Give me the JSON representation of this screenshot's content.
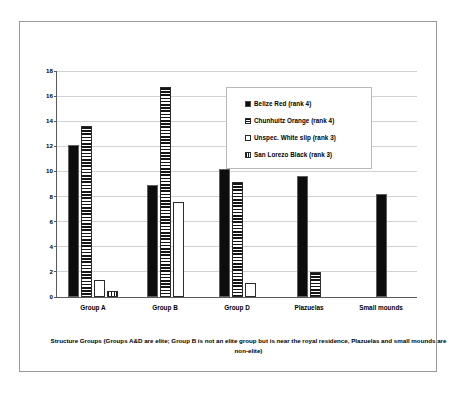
{
  "chart_data": {
    "type": "bar",
    "title": "",
    "xlabel": "Structure Groups (Groups A&D are elite; Group B is not an elite group but is near the royal residence, Plazuelas and small mounds are non-elite)",
    "ylabel": "",
    "ylim": [
      0,
      18
    ],
    "ytick_step": 2,
    "yticks": [
      0,
      2,
      4,
      6,
      8,
      10,
      12,
      14,
      16,
      18
    ],
    "grid": true,
    "grid_axis": "y",
    "legend_position": "upper-right-inside",
    "categories": [
      "Group A",
      "Group B",
      "Group D",
      "Plazuelas",
      "Small mounds"
    ],
    "series": [
      {
        "name": "Belize Red (rank 4)",
        "fill": "solid-black",
        "values": [
          12.1,
          8.9,
          10.2,
          9.6,
          8.2
        ]
      },
      {
        "name": "Chunhuitz Orange (rank 4)",
        "fill": "horizontal-hatch",
        "values": [
          13.6,
          16.7,
          9.2,
          2.0,
          null
        ]
      },
      {
        "name": "Unspec. White slip (rank 3)",
        "fill": "white",
        "values": [
          1.35,
          7.6,
          1.1,
          null,
          null
        ]
      },
      {
        "name": "San Lorezo Black (rank 3)",
        "fill": "vertical-hatch",
        "values": [
          0.5,
          null,
          null,
          null,
          null
        ]
      }
    ]
  },
  "legend": {
    "items": [
      {
        "label": "Belize Red (rank 4)"
      },
      {
        "label": "Chunhuitz Orange (rank 4)"
      },
      {
        "label": "Unspec. White slip (rank 3)"
      },
      {
        "label": "San Lorezo Black (rank 3)"
      }
    ]
  },
  "caption": {
    "text": "Structure Groups (Groups A&D are elite; Group B is not an elite group but is near the royal residence, Plazuelas and small mounds are non-elite)"
  },
  "colors": {
    "frame_border": "#9a9a9a",
    "axis": "#5a5a5a",
    "gridline": "#d2d2d2",
    "bar_solid": "#0d0d0d",
    "background": "#ffffff"
  }
}
